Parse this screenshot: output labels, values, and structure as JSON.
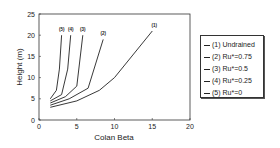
{
  "chart_data": {
    "type": "line",
    "title": "",
    "xlabel": "Colan Beta",
    "ylabel": "Height  (m)",
    "xlim": [
      0,
      20
    ],
    "ylim": [
      0,
      25
    ],
    "xticks": [
      0,
      5,
      10,
      15,
      20
    ],
    "yticks": [
      0,
      5,
      10,
      15,
      20,
      25
    ],
    "grid": false,
    "legend_position": "right-outside",
    "series": [
      {
        "name": "(1) Undrained",
        "label": "(1)",
        "x": [
          1.5,
          5,
          8,
          10,
          15
        ],
        "y": [
          3,
          4.5,
          7,
          10,
          21
        ]
      },
      {
        "name": "(2) Ru*=0.75",
        "label": "(2)",
        "x": [
          1.5,
          4,
          6.5,
          8.5
        ],
        "y": [
          3.5,
          5,
          7.5,
          19
        ]
      },
      {
        "name": "(3) Ru*=0.5",
        "label": "(3)",
        "x": [
          1.5,
          3.5,
          5,
          5.8
        ],
        "y": [
          4,
          5.5,
          8,
          20
        ]
      },
      {
        "name": "(4) Ru*=0.25",
        "label": "(4)",
        "x": [
          1.5,
          3,
          3.8,
          4.2
        ],
        "y": [
          4.5,
          6,
          12,
          20
        ]
      },
      {
        "name": "(5) Ru*=0",
        "label": "(5)",
        "x": [
          1.5,
          2.3,
          2.7,
          3
        ],
        "y": [
          5,
          7,
          12,
          20
        ]
      }
    ]
  },
  "legend": {
    "items": [
      "(1) Undrained",
      "(2) Ru*=0.75",
      "(3) Ru*=0.5",
      "(4) Ru*=0.25",
      "(5) Ru*=0"
    ]
  }
}
